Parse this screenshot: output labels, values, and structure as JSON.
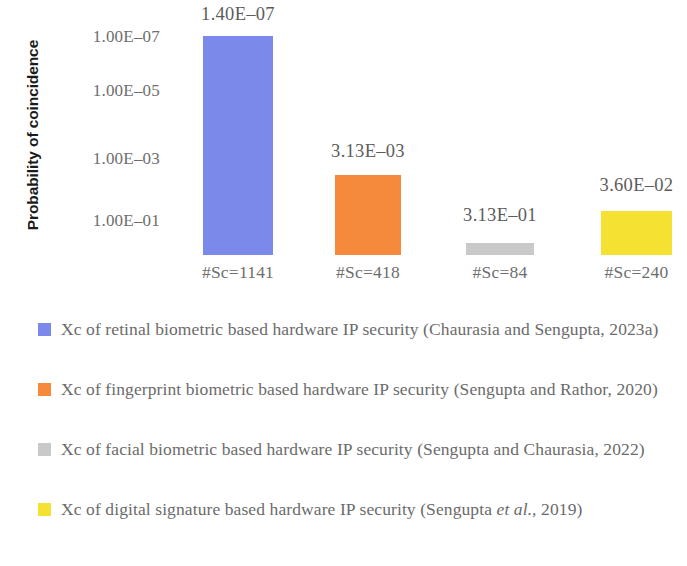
{
  "chart_data": {
    "type": "bar",
    "title": "",
    "xlabel": "",
    "ylabel": "Probability of coincidence",
    "yscale": "log",
    "y_tick_labels": [
      "1.00E–07",
      "1.00E–05",
      "1.00E–03",
      "1.00E–01"
    ],
    "y_tick_values": [
      1e-07,
      1e-05,
      0.001,
      0.1
    ],
    "ylim": [
      1,
      1e-08
    ],
    "grid": false,
    "legend_position": "bottom",
    "categories": [
      "#Sc=1141",
      "#Sc=418",
      "#Sc=84",
      "#Sc=240"
    ],
    "values": [
      1.4e-07,
      0.00313,
      0.313,
      0.036
    ],
    "value_labels": [
      "1.40E–07",
      "3.13E–03",
      "3.13E–01",
      "3.60E–02"
    ],
    "colors": [
      "#7b8aea",
      "#f58a3d",
      "#c9c9c9",
      "#f5e131"
    ],
    "series": [
      {
        "name": "Xc of retinal biometric based hardware IP security (Chaurasia and Sengupta, 2023a)",
        "category": "#Sc=1141",
        "value": 1.4e-07,
        "value_label": "1.40E–07",
        "color": "#7b8aea"
      },
      {
        "name": "Xc of fingerprint biometric based hardware IP security (Sengupta and Rathor, 2020)",
        "category": "#Sc=418",
        "value": 0.00313,
        "value_label": "3.13E–03",
        "color": "#f58a3d"
      },
      {
        "name": "Xc of facial biometric based hardware IP security (Sengupta and Chaurasia, 2022)",
        "category": "#Sc=84",
        "value": 0.313,
        "value_label": "3.13E–01",
        "color": "#c9c9c9"
      },
      {
        "name": "Xc of digital signature based hardware IP security (Sengupta et al., 2019)",
        "category": "#Sc=240",
        "value": 0.036,
        "value_label": "3.60E–02",
        "color": "#f5e131"
      }
    ]
  },
  "axis": {
    "y_title": "Probability of coincidence",
    "ticks": [
      {
        "label": "1.00E–07",
        "top": 27
      },
      {
        "label": "1.00E–05",
        "top": 81
      },
      {
        "label": "1.00E–03",
        "top": 149
      },
      {
        "label": "1.00E–01",
        "top": 211
      }
    ]
  },
  "bars": [
    {
      "name": "bar-retinal",
      "category": "#Sc=1141",
      "value_label": "1.40E–07",
      "color": "#7b8aea",
      "left": 203,
      "width": 70,
      "height": 219,
      "label_top": 4
    },
    {
      "name": "bar-fingerprint",
      "category": "#Sc=418",
      "value_label": "3.13E–03",
      "color": "#f58a3d",
      "left": 335,
      "width": 66,
      "height": 80,
      "label_top": 141
    },
    {
      "name": "bar-facial",
      "category": "#Sc=84",
      "value_label": "3.13E–01",
      "color": "#c9c9c9",
      "left": 466,
      "width": 68,
      "height": 12,
      "label_top": 205
    },
    {
      "name": "bar-digital-signature",
      "category": "#Sc=240",
      "value_label": "3.60E–02",
      "color": "#f5e131",
      "left": 601,
      "width": 71,
      "height": 44,
      "label_top": 175
    }
  ],
  "legend": {
    "entries": [
      {
        "color": "#7b8aea",
        "text_pre": "Xc of retinal biometric based hardware IP security (Chaurasia and Sengupta, 2023a)",
        "italic": "",
        "text_post": "",
        "top": 11
      },
      {
        "color": "#f58a3d",
        "text_pre": "Xc of fingerprint biometric based hardware IP security (Sengupta and Rathor, 2020)",
        "italic": "",
        "text_post": "",
        "top": 71
      },
      {
        "color": "#c9c9c9",
        "text_pre": "Xc of facial biometric based hardware IP security (Sengupta and Chaurasia, 2022)",
        "italic": "",
        "text_post": "",
        "top": 131
      },
      {
        "color": "#f5e131",
        "text_pre": "Xc of digital signature based hardware IP security (Sengupta ",
        "italic": "et al.,",
        "text_post": " 2019)",
        "top": 191
      }
    ]
  }
}
